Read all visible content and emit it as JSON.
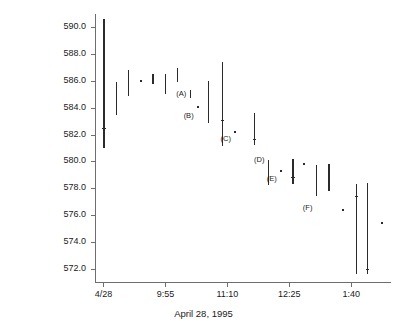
{
  "chart_data": {
    "type": "bar",
    "chart_subtype": "high-low price range bars (OHLC-style)",
    "title": "",
    "xlabel": "April 28, 1995",
    "ylabel": "Price",
    "grid": false,
    "legend": null,
    "ylim": [
      571.0,
      591.0
    ],
    "yticks": [
      572.0,
      574.0,
      576.0,
      578.0,
      580.0,
      582.0,
      584.0,
      586.0,
      588.0,
      590.0
    ],
    "ytick_labels": [
      "572.0",
      "574.0",
      "576.0",
      "578.0",
      "580.0",
      "582.0",
      "584.0",
      "586.0",
      "588.0",
      "590.0"
    ],
    "xticks": [
      0,
      5,
      10,
      15,
      20
    ],
    "xtick_labels": [
      "4/28",
      "9:55",
      "11:10",
      "12:25",
      "1:40"
    ],
    "xlim": [
      -0.6,
      23.2
    ],
    "series": [
      {
        "name": "Price range",
        "bars": [
          {
            "index": 0,
            "x": 0.05,
            "high": 590.6,
            "low": 581.0,
            "close": 582.5
          },
          {
            "index": 1,
            "x": 1.05,
            "high": 585.95,
            "low": 583.45,
            "close": null
          },
          {
            "index": 2,
            "x": 2.0,
            "high": 586.85,
            "low": 584.9,
            "close": null
          },
          {
            "index": 3,
            "x": 3.0,
            "high": 586.0,
            "low": 585.9,
            "close": null
          },
          {
            "index": 4,
            "x": 4.0,
            "high": 586.5,
            "low": 585.8,
            "close": null
          },
          {
            "index": 5,
            "x": 5.0,
            "high": 586.5,
            "low": 585.0,
            "close": null
          },
          {
            "index": 6,
            "x": 6.0,
            "high": 586.95,
            "low": 585.95,
            "close": null
          },
          {
            "index": 7,
            "x": 7.0,
            "high": 585.3,
            "low": 584.7,
            "close": null,
            "label": "(A)"
          },
          {
            "index": 8,
            "x": 7.6,
            "high": 584.1,
            "low": 584.05,
            "close": null,
            "label": "(B)"
          },
          {
            "index": 9,
            "x": 8.5,
            "high": 586.0,
            "low": 582.9,
            "close": null
          },
          {
            "index": 10,
            "x": 9.6,
            "high": 587.45,
            "low": 581.15,
            "close": 583.1
          },
          {
            "index": 11,
            "x": 10.6,
            "high": 582.2,
            "low": 582.1,
            "close": null,
            "label": "(C)"
          },
          {
            "index": 12,
            "x": 12.2,
            "high": 583.6,
            "low": 581.2,
            "close": 581.7
          },
          {
            "index": 13,
            "x": 13.3,
            "high": 580.1,
            "low": 578.25,
            "close": null,
            "label": "(D)"
          },
          {
            "index": 14,
            "x": 14.3,
            "high": 579.3,
            "low": 579.2,
            "close": null,
            "label": "(E)"
          },
          {
            "index": 15,
            "x": 15.3,
            "high": 580.2,
            "low": 578.3,
            "close": 578.85
          },
          {
            "index": 16,
            "x": 16.2,
            "high": 579.8,
            "low": 579.75,
            "close": null
          },
          {
            "index": 17,
            "x": 17.2,
            "high": 579.7,
            "low": 577.4,
            "close": null,
            "label": "(F)"
          },
          {
            "index": 18,
            "x": 18.2,
            "high": 579.8,
            "low": 577.8,
            "close": null
          },
          {
            "index": 19,
            "x": 19.3,
            "high": 576.4,
            "low": 576.35,
            "close": null
          },
          {
            "index": 20,
            "x": 20.4,
            "high": 578.35,
            "low": 571.6,
            "close": 577.4
          },
          {
            "index": 21,
            "x": 21.3,
            "high": 578.4,
            "low": 571.6,
            "close": 572.0
          },
          {
            "index": 22,
            "x": 22.5,
            "high": 575.45,
            "low": 575.4,
            "close": null
          }
        ]
      }
    ],
    "annotations": [
      {
        "text": "(A)",
        "x": 7.0,
        "y": 585.0
      },
      {
        "text": "(B)",
        "x": 7.6,
        "y": 583.4
      },
      {
        "text": "(C)",
        "x": 10.6,
        "y": 581.7
      },
      {
        "text": "(D)",
        "x": 13.3,
        "y": 580.1
      },
      {
        "text": "(E)",
        "x": 14.3,
        "y": 578.7
      },
      {
        "text": "(F)",
        "x": 17.2,
        "y": 576.5
      }
    ],
    "colors": {
      "bar": "#2b2b2b",
      "axis": "#6e6e6e",
      "text": "#1a1a1a",
      "background": "#ffffff"
    }
  }
}
